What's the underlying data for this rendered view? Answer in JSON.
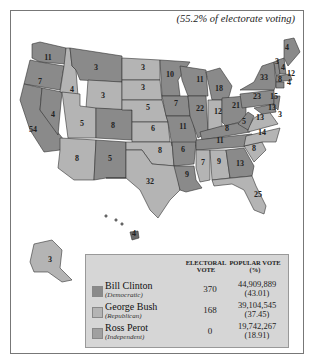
{
  "caption": "(55.2% of electorate voting)",
  "colors": {
    "democratic": "#8a8a8a",
    "republican": "#b4b4b4",
    "independent": "#a0a0a0",
    "border": "#333333"
  },
  "legend": {
    "header_electoral": "ELECTORAL VOTE",
    "header_popular": "POPULAR VOTE (%)",
    "rows": [
      {
        "name": "Bill Clinton",
        "party": "(Democratic)",
        "electoral": "370",
        "popular": "44,909,889",
        "percent": "(43.01)"
      },
      {
        "name": "George Bush",
        "party": "(Republican)",
        "electoral": "168",
        "popular": "39,104,545",
        "percent": "(37.45)"
      },
      {
        "name": "Ross Perot",
        "party": "(Independent)",
        "electoral": "0",
        "popular": "19,742,267",
        "percent": "(18.91)"
      }
    ]
  },
  "states": [
    {
      "label": "11",
      "x": 48,
      "y": 60
    },
    {
      "label": "7",
      "x": 40,
      "y": 84
    },
    {
      "label": "54",
      "x": 33,
      "y": 132
    },
    {
      "label": "4",
      "x": 53,
      "y": 117
    },
    {
      "label": "4",
      "x": 72,
      "y": 92
    },
    {
      "label": "3",
      "x": 96,
      "y": 70
    },
    {
      "label": "3",
      "x": 103,
      "y": 98
    },
    {
      "label": "5",
      "x": 82,
      "y": 126
    },
    {
      "label": "8",
      "x": 77,
      "y": 161
    },
    {
      "label": "8",
      "x": 113,
      "y": 128
    },
    {
      "label": "5",
      "x": 110,
      "y": 161
    },
    {
      "label": "3",
      "x": 143,
      "y": 70
    },
    {
      "label": "3",
      "x": 143,
      "y": 90
    },
    {
      "label": "5",
      "x": 148,
      "y": 110
    },
    {
      "label": "6",
      "x": 153,
      "y": 131
    },
    {
      "label": "8",
      "x": 160,
      "y": 153
    },
    {
      "label": "32",
      "x": 150,
      "y": 184
    },
    {
      "label": "10",
      "x": 170,
      "y": 77
    },
    {
      "label": "7",
      "x": 176,
      "y": 106
    },
    {
      "label": "11",
      "x": 183,
      "y": 129
    },
    {
      "label": "6",
      "x": 183,
      "y": 152
    },
    {
      "label": "9",
      "x": 187,
      "y": 177
    },
    {
      "label": "11",
      "x": 200,
      "y": 82
    },
    {
      "label": "22",
      "x": 200,
      "y": 111
    },
    {
      "label": "18",
      "x": 219,
      "y": 91
    },
    {
      "label": "12",
      "x": 218,
      "y": 114
    },
    {
      "label": "21",
      "x": 236,
      "y": 108
    },
    {
      "label": "8",
      "x": 227,
      "y": 131
    },
    {
      "label": "11",
      "x": 220,
      "y": 143
    },
    {
      "label": "7",
      "x": 203,
      "y": 165
    },
    {
      "label": "9",
      "x": 219,
      "y": 164
    },
    {
      "label": "13",
      "x": 240,
      "y": 166
    },
    {
      "label": "8",
      "x": 254,
      "y": 151
    },
    {
      "label": "14",
      "x": 262,
      "y": 135
    },
    {
      "label": "13",
      "x": 260,
      "y": 120
    },
    {
      "label": "5",
      "x": 244,
      "y": 124
    },
    {
      "label": "23",
      "x": 257,
      "y": 99
    },
    {
      "label": "33",
      "x": 264,
      "y": 80
    },
    {
      "label": "25",
      "x": 258,
      "y": 197
    },
    {
      "label": "4",
      "x": 287,
      "y": 50
    },
    {
      "label": "3",
      "x": 277,
      "y": 64
    },
    {
      "label": "4",
      "x": 283,
      "y": 70
    },
    {
      "label": "12",
      "x": 291,
      "y": 76
    },
    {
      "label": "8",
      "x": 280,
      "y": 82
    },
    {
      "label": "4",
      "x": 289,
      "y": 85
    },
    {
      "label": "15",
      "x": 274,
      "y": 99
    },
    {
      "label": "13",
      "x": 272,
      "y": 110
    },
    {
      "label": "3",
      "x": 280,
      "y": 117
    },
    {
      "label": "3",
      "x": 50,
      "y": 262
    },
    {
      "label": "4",
      "x": 134,
      "y": 236
    }
  ]
}
